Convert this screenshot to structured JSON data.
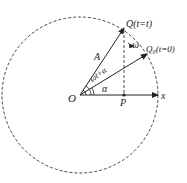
{
  "diagram": {
    "labels": {
      "origin": "O",
      "point_p": "P",
      "x_axis": "x",
      "amplitude": "A",
      "q_t": "Q(t=t)",
      "q0": "Q₀(t=0)",
      "angle_total": "ωt+α",
      "angle_initial": "α",
      "angular_velocity": "ω"
    },
    "colors": {
      "line": "#222222",
      "background": "#ffffff"
    }
  }
}
